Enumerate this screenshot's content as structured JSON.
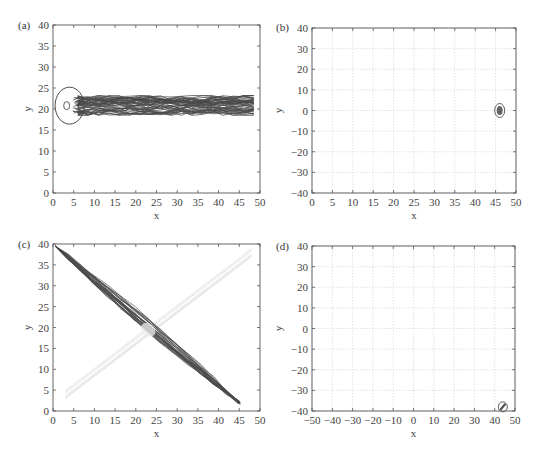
{
  "chart_data": [
    {
      "panel": "(a)",
      "type": "line",
      "title": "",
      "xlabel": "x",
      "ylabel": "y",
      "xlim": [
        0,
        50
      ],
      "ylim": [
        0,
        40
      ],
      "xticks": [
        0,
        5,
        10,
        15,
        20,
        25,
        30,
        35,
        40,
        45,
        50
      ],
      "yticks": [
        0,
        5,
        10,
        15,
        20,
        25,
        30,
        35,
        40
      ],
      "grid": false,
      "series": [
        {
          "name": "trajectories",
          "description": "dense horizontal band of looping trajectories",
          "x_range": [
            3,
            49.5
          ],
          "y_range": [
            18.5,
            23.2
          ],
          "center_y": 20.8
        }
      ]
    },
    {
      "panel": "(b)",
      "type": "line",
      "title": "",
      "xlabel": "x",
      "ylabel": "y",
      "xlim": [
        0,
        50
      ],
      "ylim": [
        -40,
        40
      ],
      "xticks": [
        0,
        5,
        10,
        15,
        20,
        25,
        30,
        35,
        40,
        45,
        50
      ],
      "yticks": [
        -40,
        -30,
        -20,
        -10,
        0,
        10,
        20,
        30,
        40
      ],
      "grid": true,
      "series": [
        {
          "name": "cluster",
          "description": "small tight cluster",
          "center": [
            46,
            0
          ],
          "x_range": [
            45,
            47
          ],
          "y_range": [
            -3,
            3
          ]
        }
      ]
    },
    {
      "panel": "(c)",
      "type": "line",
      "title": "",
      "xlabel": "x",
      "ylabel": "y",
      "xlim": [
        0,
        50
      ],
      "ylim": [
        0,
        40
      ],
      "xticks": [
        0,
        5,
        10,
        15,
        20,
        25,
        30,
        35,
        40,
        45,
        50
      ],
      "yticks": [
        0,
        5,
        10,
        15,
        20,
        25,
        30,
        35,
        40
      ],
      "grid": false,
      "series": [
        {
          "name": "dark diagonal band",
          "description": "trajectories from (0,40) to (45,2)",
          "start": [
            0.5,
            39.5
          ],
          "end": [
            45,
            2
          ]
        },
        {
          "name": "light diagonal band",
          "description": "faint trajectories from (3,4) to (48,38)",
          "start": [
            3,
            4
          ],
          "end": [
            48,
            38
          ]
        },
        {
          "name": "crossing",
          "center": [
            23,
            19.5
          ]
        }
      ]
    },
    {
      "panel": "(d)",
      "type": "line",
      "title": "",
      "xlabel": "x",
      "ylabel": "y",
      "xlim": [
        -50,
        50
      ],
      "ylim": [
        -40,
        40
      ],
      "xticks": [
        -50,
        -40,
        -30,
        -20,
        -10,
        0,
        10,
        20,
        30,
        40,
        50
      ],
      "yticks": [
        -40,
        -30,
        -20,
        -10,
        0,
        10,
        20,
        30,
        40
      ],
      "grid": true,
      "series": [
        {
          "name": "cluster",
          "description": "small tight cluster",
          "center": [
            44,
            -38
          ],
          "x_range": [
            43,
            46
          ],
          "y_range": [
            -40,
            -36
          ]
        }
      ]
    }
  ],
  "panels": {
    "a": {
      "label": "(a)",
      "xlabel": "x",
      "ylabel": "y"
    },
    "b": {
      "label": "(b)",
      "xlabel": "x",
      "ylabel": "y"
    },
    "c": {
      "label": "(c)",
      "xlabel": "x",
      "ylabel": "y"
    },
    "d": {
      "label": "(d)",
      "xlabel": "x",
      "ylabel": "y"
    }
  },
  "colors": {
    "trajectory": "#4a4a4a",
    "trajectory_light": "#d8d8d8",
    "axis": "#555555",
    "grid": "#cfcfcf"
  }
}
